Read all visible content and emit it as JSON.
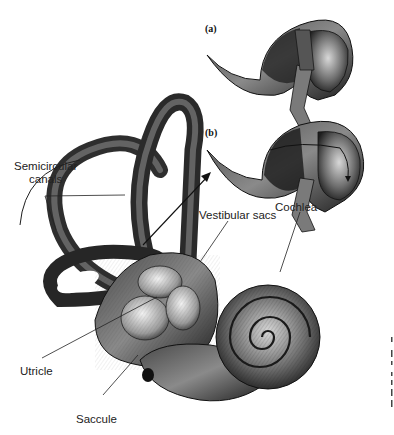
{
  "figure": {
    "panels": [
      {
        "id": "a",
        "label": "(a)"
      },
      {
        "id": "b",
        "label": "(b)"
      }
    ],
    "labels": {
      "semicircular_line1": "Semicircular",
      "semicircular_line2": "canals",
      "vestibular_sacs": "Vestibular sacs",
      "cochlea": "Cochlea",
      "utricle": "Utricle",
      "saccule": "Saccule"
    },
    "colors": {
      "ink": "#1a1a1a",
      "shade_dark": "#2a2a2a",
      "shade_mid": "#6b6b6b",
      "shade_light": "#c9c9c9",
      "background": "#ffffff"
    }
  }
}
